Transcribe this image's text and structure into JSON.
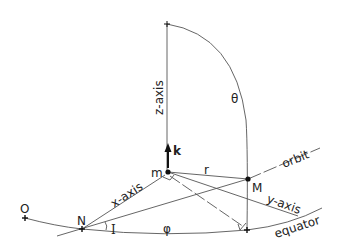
{
  "diagram": {
    "labels": {
      "z_axis": "z-axis",
      "x_axis": "x-axis",
      "y_axis": "y-axis",
      "k": "k",
      "m": "m",
      "M": "M",
      "N": "N",
      "O": "O",
      "r": "r",
      "theta": "θ",
      "phi": "φ",
      "I": "I",
      "orbit": "orbit",
      "equator": "equator"
    }
  }
}
